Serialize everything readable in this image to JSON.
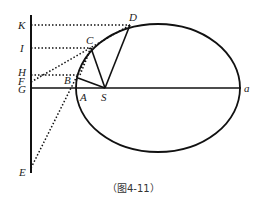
{
  "diagram": {
    "caption": "（图4-11）",
    "labels": {
      "K": "K",
      "I": "I",
      "H": "H",
      "F": "F",
      "G": "G",
      "E": "E",
      "B": "B",
      "A": "A",
      "S": "S",
      "C": "C",
      "D": "D",
      "a": "a"
    },
    "colors": {
      "stroke": "#111111",
      "text": "#222222"
    }
  }
}
